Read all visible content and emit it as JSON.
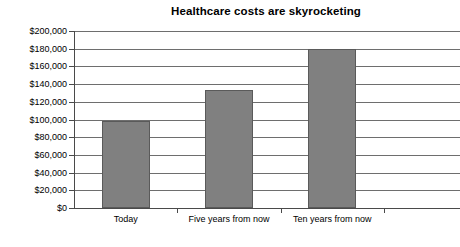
{
  "chart_data": {
    "type": "bar",
    "title": "Healthcare costs are skyrocketing",
    "xlabel": "",
    "ylabel": "",
    "categories": [
      "Today",
      "Five years from now",
      "Ten years from now"
    ],
    "values": [
      98000,
      133000,
      180000
    ],
    "ylim": [
      0,
      200000
    ],
    "ytick_values": [
      0,
      20000,
      40000,
      60000,
      80000,
      100000,
      120000,
      140000,
      160000,
      180000,
      200000
    ],
    "ytick_labels": [
      "$0",
      "$20,000",
      "$40,000",
      "$60,000",
      "$80,000",
      "$100,000",
      "$120,000",
      "$140,000",
      "$160,000",
      "$180,000",
      "$200,000"
    ],
    "grid": true,
    "grid_axis": "y",
    "legend": false,
    "legend_position": "none",
    "bar_color": "#808080",
    "bar_edge_color": "#5a5a5a",
    "gridline_color": "#6e6e6e",
    "axis_color": "#4a4a4a",
    "background_color": "#ffffff",
    "text_color": "#000000"
  }
}
